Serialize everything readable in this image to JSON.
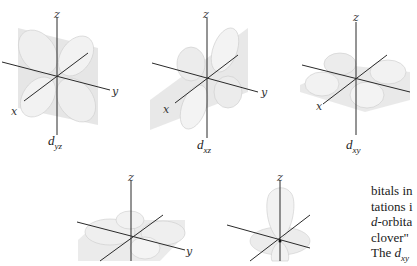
{
  "figure": {
    "panels": [
      {
        "id": "dyz",
        "label_main": "d",
        "label_sub": "yz",
        "axes": {
          "z": "z",
          "x": "x",
          "y": "y"
        }
      },
      {
        "id": "dxz",
        "label_main": "d",
        "label_sub": "xz",
        "axes": {
          "z": "z",
          "x": "x",
          "y": "y"
        }
      },
      {
        "id": "dxy",
        "label_main": "d",
        "label_sub": "xy",
        "axes": {
          "z": "z",
          "x": "x",
          "y": "y"
        }
      },
      {
        "id": "dx2-y2",
        "axes": {
          "z": "z",
          "y": "y"
        }
      },
      {
        "id": "dz2",
        "axes": {
          "z": "z"
        }
      }
    ]
  },
  "body_text": {
    "lines": [
      {
        "pre": "",
        "italic": "",
        "post": "bitals in"
      },
      {
        "pre": "",
        "italic": "",
        "post": "tations i"
      },
      {
        "pre": "",
        "italic": "d",
        "post": "-orbita"
      },
      {
        "pre": "",
        "italic": "",
        "post": "clover\""
      },
      {
        "pre": "The ",
        "italic": "d",
        "sub": "xy",
        "post": ""
      }
    ]
  },
  "colors": {
    "lobe_fill": "#ececec",
    "lobe_stroke": "#c8c8c8",
    "plane_fill": "#dcdcdc",
    "axis": "#2a2a2a"
  }
}
